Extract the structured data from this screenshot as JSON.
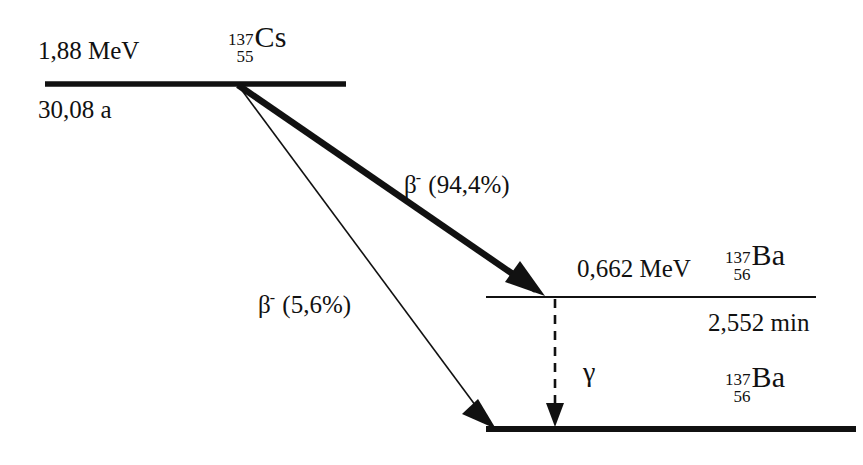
{
  "diagram": {
    "ink_color": "#111111",
    "background_color": "#ffffff"
  },
  "levels": [
    {
      "id": "cs137",
      "energy": "1,88 MeV",
      "half_life": "30,08 a",
      "mass_number": "137",
      "atomic_number": "55",
      "symbol": "Cs"
    },
    {
      "id": "ba137m",
      "energy": "0,662 MeV",
      "half_life": "2,552 min",
      "mass_number": "137",
      "atomic_number": "56",
      "symbol": "Ba"
    },
    {
      "id": "ba137",
      "energy": "",
      "half_life": "",
      "mass_number": "137",
      "atomic_number": "56",
      "symbol": "Ba"
    }
  ],
  "transitions": [
    {
      "id": "beta-major",
      "particle": "β",
      "charge": "-",
      "branching": "(94,4%)",
      "style": "thick-solid"
    },
    {
      "id": "beta-minor",
      "particle": "β",
      "charge": "-",
      "branching": "(5,6%)",
      "style": "thin-solid"
    },
    {
      "id": "gamma",
      "particle": "γ",
      "charge": "",
      "branching": "",
      "style": "dashed-vertical"
    }
  ]
}
